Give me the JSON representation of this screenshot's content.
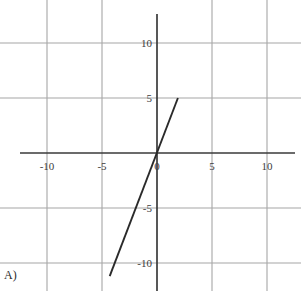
{
  "choice": {
    "label": "A)"
  },
  "chart_data": {
    "type": "line",
    "title": "",
    "subtitle": "",
    "xlabel": "",
    "ylabel": "",
    "xlim": [
      -11.5,
      13.0
    ],
    "ylim": [
      -12.5,
      12.1
    ],
    "xticks": [
      -10,
      -5,
      0,
      5,
      10
    ],
    "yticks": [
      10,
      5,
      -5,
      -10
    ],
    "xtick_labels": [
      "-10",
      "-5",
      "0",
      "5",
      "10"
    ],
    "ytick_labels": [
      "10",
      "5",
      "-5",
      "-10"
    ],
    "grid": true,
    "grid_spacing": 5,
    "legend": "none",
    "axis_color": "#3a3a3a",
    "grid_color": "#a6a6a6",
    "line_color": "#2a2a2a",
    "background_color": "#ffffff",
    "series": [
      {
        "name": "line",
        "slope": 2.6,
        "intercept": 0,
        "equation": "y = 2.6x",
        "x": [
          -4.3,
          1.9
        ],
        "y": [
          -11.2,
          5.0
        ],
        "points": [
          {
            "x": -4.3,
            "y": -11.2
          },
          {
            "x": 0.0,
            "y": 0.0
          },
          {
            "x": 1.9,
            "y": 5.0
          },
          {
            "x": 1.9,
            "y": 5.0
          }
        ]
      }
    ]
  }
}
